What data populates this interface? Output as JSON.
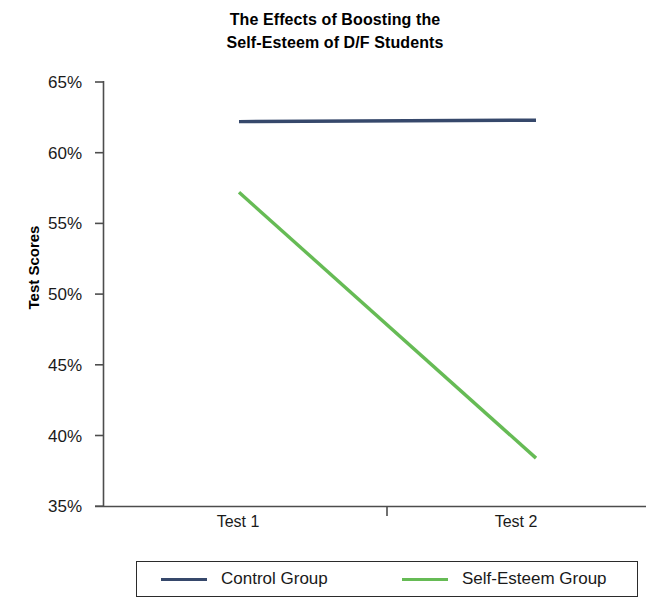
{
  "chart_data": {
    "type": "line",
    "title": "The Effects of Boosting the Self-Esteem of D/F Students",
    "title_lines": [
      "The Effects of Boosting the",
      "Self-Esteem of D/F Students"
    ],
    "xlabel": "",
    "ylabel": "Test Scores",
    "categories": [
      "Test 1",
      "Test 2"
    ],
    "x_tick_labels": [
      "Test 1",
      "Test 2"
    ],
    "y_tick_labels": [
      "65%",
      "60%",
      "55%",
      "50%",
      "45%",
      "40%",
      "35%"
    ],
    "y_tick_values": [
      65,
      60,
      55,
      50,
      45,
      40,
      35
    ],
    "ylim": [
      35,
      65
    ],
    "y_unit": "%",
    "grid": false,
    "legend_position": "bottom",
    "series": [
      {
        "name": "Control Group",
        "color": "#36486b",
        "values": [
          62.2,
          62.3
        ]
      },
      {
        "name": "Self-Esteem Group",
        "color": "#66bb55",
        "values": [
          57.2,
          38.4
        ]
      }
    ]
  },
  "axis": {
    "line_color": "#4d4d4d"
  },
  "legend": {
    "entries": [
      {
        "label": "Control Group",
        "color": "#36486b"
      },
      {
        "label": "Self-Esteem Group",
        "color": "#66bb55"
      }
    ]
  }
}
